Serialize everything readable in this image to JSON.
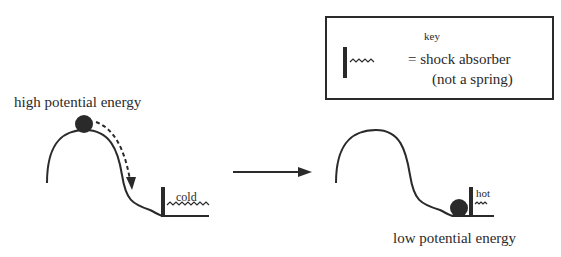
{
  "key": {
    "title": "key",
    "line1": "= shock absorber",
    "line2": "(not a spring)"
  },
  "left": {
    "label": "high potential energy",
    "absorber_label": "cold"
  },
  "right": {
    "label": "low potential energy",
    "absorber_label": "hot"
  },
  "colors": {
    "ink": "#2a2a2a",
    "background": "#ffffff"
  }
}
